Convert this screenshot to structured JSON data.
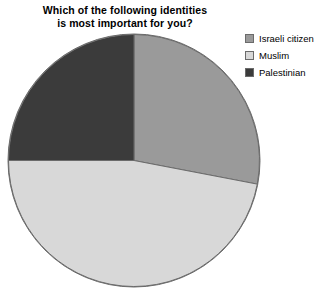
{
  "chart": {
    "title": "Which of the following identities\nis most important for you?",
    "title_line1": "Which of the following identities",
    "title_line2": "is most important for you?"
  },
  "legend": {
    "position": "top-right",
    "items": [
      {
        "label": "Israeli citizen",
        "color": "#9a9a9a",
        "swatch_name": "legend-swatch-israeli-citizen"
      },
      {
        "label": "Muslim",
        "color": "#d8d8d8",
        "swatch_name": "legend-swatch-muslim"
      },
      {
        "label": "Palestinian",
        "color": "#3b3b3b",
        "swatch_name": "legend-swatch-palestinian"
      }
    ]
  },
  "chart_data": {
    "type": "pie",
    "title": "Which of the following identities is most important for you?",
    "xlabel": "",
    "ylabel": "",
    "labels": [
      "Israeli citizen",
      "Muslim",
      "Palestinian"
    ],
    "values": [
      28,
      47,
      25
    ],
    "unit": "percent",
    "colors": [
      "#9a9a9a",
      "#d8d8d8",
      "#3b3b3b"
    ],
    "start_angle_deg": 0,
    "direction": "clockwise",
    "legend": [
      "Israeli citizen",
      "Muslim",
      "Palestinian"
    ],
    "legend_position": "top-right",
    "grid": false,
    "data_labels_shown": false,
    "slice_geometry_deg": [
      {
        "label": "Israeli citizen",
        "from": 0,
        "to": 100.8
      },
      {
        "label": "Muslim",
        "from": 100.8,
        "to": 270.0
      },
      {
        "label": "Palestinian",
        "from": 270.0,
        "to": 360.0
      }
    ]
  },
  "style": {
    "background": "#ffffff",
    "outline": "#6b6b6b"
  }
}
